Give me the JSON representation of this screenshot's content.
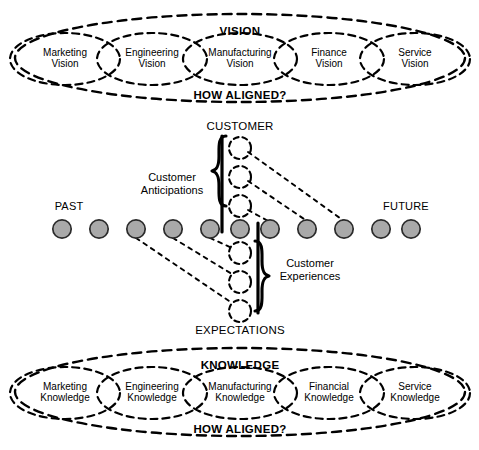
{
  "diagram": {
    "colors": {
      "stroke": "#000000",
      "circle_fill": "#a9a9a9",
      "circle_stroke": "#2b2b2b",
      "background": "#ffffff"
    }
  },
  "vision_band": {
    "outer_top_label": "VISION",
    "outer_bottom_label": "HOW ALIGNED?",
    "nodes": [
      {
        "line1": "Marketing",
        "line2": "Vision"
      },
      {
        "line1": "Engineering",
        "line2": "Vision"
      },
      {
        "line1": "Manufacturing",
        "line2": "Vision"
      },
      {
        "line1": "Finance",
        "line2": "Vision"
      },
      {
        "line1": "Service",
        "line2": "Vision"
      }
    ]
  },
  "knowledge_band": {
    "outer_top_label": "KNOWLEDGE",
    "outer_bottom_label": "HOW ALIGNED?",
    "nodes": [
      {
        "line1": "Marketing",
        "line2": "Knowledge"
      },
      {
        "line1": "Engineering",
        "line2": "Knowledge"
      },
      {
        "line1": "Manufacturing",
        "line2": "Knowledge"
      },
      {
        "line1": "Financial",
        "line2": "Knowledge"
      },
      {
        "line1": "Service",
        "line2": "Knowledge"
      }
    ]
  },
  "timeline": {
    "past_label": "PAST",
    "future_label": "FUTURE",
    "node_count": 12,
    "highlight_index": 5
  },
  "center": {
    "top_axis_label": "CUSTOMER",
    "bottom_axis_label": "EXPECTATIONS",
    "anticipations_label_line1": "Customer",
    "anticipations_label_line2": "Anticipations",
    "experiences_label_line1": "Customer",
    "experiences_label_line2": "Experiences",
    "anticipation_node_count": 3,
    "experience_node_count": 3
  }
}
